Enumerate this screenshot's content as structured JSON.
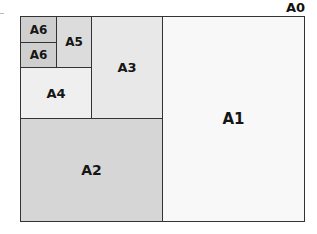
{
  "diagram": {
    "title": "A0",
    "sheets": [
      {
        "id": "A1",
        "label": "A1",
        "fill": "#f8f8f8"
      },
      {
        "id": "A2",
        "label": "A2",
        "fill": "#d6d6d6"
      },
      {
        "id": "A3",
        "label": "A3",
        "fill": "#e8e8e8"
      },
      {
        "id": "A4",
        "label": "A4",
        "fill": "#efefef"
      },
      {
        "id": "A5",
        "label": "A5",
        "fill": "#dcdcdc"
      },
      {
        "id": "A6a",
        "label": "A6",
        "fill": "#cfcfcf"
      },
      {
        "id": "A6b",
        "label": "A6",
        "fill": "#cfcfcf"
      }
    ]
  }
}
